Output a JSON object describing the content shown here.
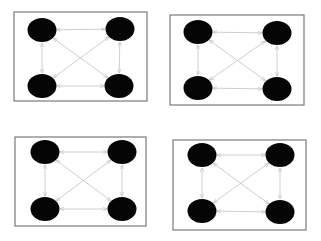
{
  "colors": {
    "node": "#050505",
    "edge": "#c8c8c8",
    "frame": "#7a7a7a",
    "background": "#ffffff"
  },
  "graph": {
    "node_count": 4,
    "edge_count": 6,
    "edges": [
      "TL-TR",
      "TL-BL",
      "TR-BR",
      "BL-BR",
      "TL-BR",
      "TR-BL"
    ],
    "directed": "bidirectional",
    "node_shape": "filled-ellipse"
  },
  "panels": [
    {
      "id": "panel-1",
      "frame": [
        14,
        12,
        133,
        89
      ],
      "nodes": {
        "TL": [
          42,
          30
        ],
        "TR": [
          120,
          29
        ],
        "BL": [
          42,
          86
        ],
        "BR": [
          119,
          86
        ]
      }
    },
    {
      "id": "panel-2",
      "frame": [
        170,
        15,
        134,
        90
      ],
      "nodes": {
        "TL": [
          198,
          32
        ],
        "TR": [
          277,
          33
        ],
        "BL": [
          198,
          88
        ],
        "BR": [
          277,
          89
        ]
      }
    },
    {
      "id": "panel-3",
      "frame": [
        15,
        137,
        131,
        89
      ],
      "nodes": {
        "TL": [
          45,
          152
        ],
        "TR": [
          122,
          152
        ],
        "BL": [
          45,
          209
        ],
        "BR": [
          122,
          209
        ]
      }
    },
    {
      "id": "panel-4",
      "frame": [
        173,
        140,
        133,
        90
      ],
      "nodes": {
        "TL": [
          202,
          155
        ],
        "TR": [
          280,
          155
        ],
        "BL": [
          202,
          211
        ],
        "BR": [
          280,
          212
        ]
      }
    }
  ]
}
